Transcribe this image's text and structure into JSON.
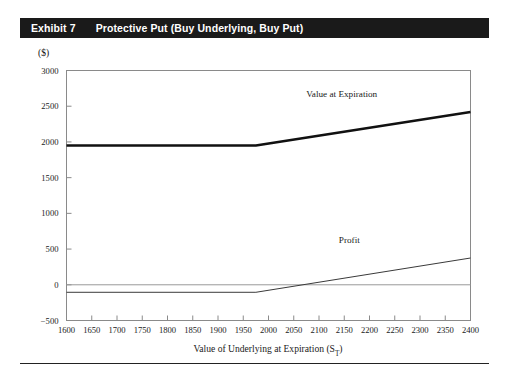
{
  "exhibit": {
    "label": "Exhibit 7",
    "title": "Protective Put (Buy Underlying, Buy Put)",
    "bar_color": "#1a1a1a"
  },
  "chart_data": {
    "type": "line",
    "title": "Protective Put (Buy Underlying, Buy Put)",
    "xlabel": "Value of Underlying at Expiration (S",
    "xlabel_sub": "T",
    "xlabel_suffix": ")",
    "ylabel": "($)",
    "xlim": [
      1600,
      2400
    ],
    "ylim": [
      -500,
      3000
    ],
    "grid": false,
    "zero_line": true,
    "legend_position": "inline-annotations",
    "x_ticks": [
      1600,
      1650,
      1700,
      1750,
      1800,
      1850,
      1900,
      1950,
      2000,
      2050,
      2100,
      2150,
      2200,
      2250,
      2300,
      2350,
      2400
    ],
    "y_ticks": [
      -500,
      0,
      500,
      1000,
      1500,
      2000,
      2500,
      3000
    ],
    "breakeven_x": 1975,
    "series": [
      {
        "name": "Value at Expiration",
        "style": "thick",
        "color": "#111111",
        "width": 2.6,
        "x": [
          1600,
          1975,
          2400
        ],
        "y": [
          1950,
          1950,
          2420
        ],
        "label": "Value at Expiration",
        "label_x": 2145,
        "label_y": 2625
      },
      {
        "name": "Profit",
        "style": "thin",
        "color": "#3a3a3a",
        "width": 1.0,
        "x": [
          1600,
          1975,
          2400
        ],
        "y": [
          -105,
          -105,
          375
        ],
        "label": "Profit",
        "label_x": 2160,
        "label_y": 590
      }
    ]
  }
}
